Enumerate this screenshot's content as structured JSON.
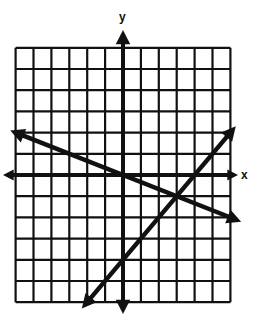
{
  "chart_data": {
    "type": "line",
    "title": "",
    "xlabel": "x",
    "ylabel": "y",
    "xlim": [
      -6,
      6
    ],
    "ylim": [
      -6,
      6
    ],
    "grid": true,
    "series": [
      {
        "name": "line-decreasing",
        "equation": "y = -x/3",
        "points": [
          [
            -6.3,
            2.1
          ],
          [
            6.6,
            -2.2
          ]
        ]
      },
      {
        "name": "line-increasing",
        "equation": "y = x - 4",
        "points": [
          [
            -2.3,
            -6.3
          ],
          [
            6.3,
            2.3
          ]
        ]
      }
    ],
    "intersection": [
      3,
      -1
    ]
  },
  "axes": {
    "x_label": "x",
    "y_label": "y"
  },
  "colors": {
    "ink": "#111111",
    "background": "#ffffff"
  }
}
